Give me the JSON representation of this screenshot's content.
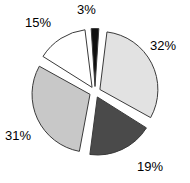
{
  "chart_data": {
    "type": "pie",
    "title": "",
    "subtitle": "",
    "xlabel": "",
    "ylabel": "",
    "legend": "none",
    "grid": false,
    "exploded": true,
    "label_format": "percent",
    "categories": [
      "32%",
      "19%",
      "31%",
      "15%",
      "3%"
    ],
    "values": [
      32,
      19,
      31,
      15,
      3
    ],
    "labels": [
      "32%",
      "19%",
      "31%",
      "15%",
      "3%"
    ],
    "colors": [
      "#e2e2e2",
      "#4a4a4a",
      "#c8c8c8",
      "#ffffff",
      "#101010"
    ],
    "outline_color": "#3a3a3a",
    "background_color": "#ffffff",
    "slices": [
      {
        "label": "32%",
        "value": 32,
        "color": "#e2e2e2",
        "start_angle": 9,
        "end_angle": 124
      },
      {
        "label": "19%",
        "value": 19,
        "color": "#4a4a4a",
        "start_angle": 124,
        "end_angle": 193
      },
      {
        "label": "31%",
        "value": 31,
        "color": "#c8c8c8",
        "start_angle": 193,
        "end_angle": 304
      },
      {
        "label": "15%",
        "value": 15,
        "color": "#ffffff",
        "start_angle": 304,
        "end_angle": 358
      },
      {
        "label": "3%",
        "value": 3,
        "color": "#101010",
        "start_angle": 358,
        "end_angle": 9
      }
    ]
  },
  "labels": {
    "slice_32": "32%",
    "slice_19": "19%",
    "slice_31": "31%",
    "slice_15": "15%",
    "slice_3": "3%"
  }
}
